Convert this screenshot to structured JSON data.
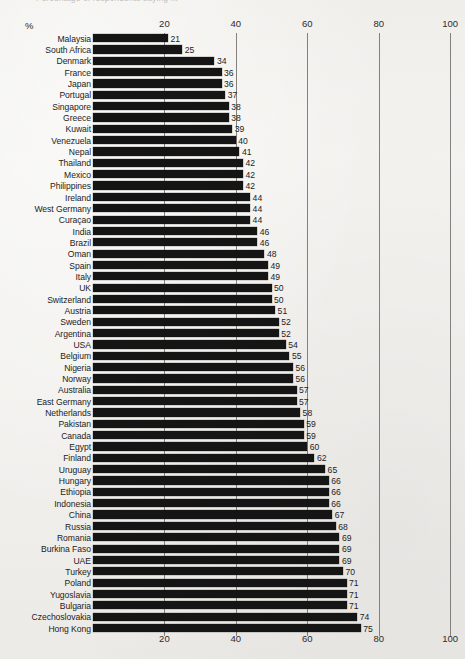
{
  "caption": {
    "clipped_text": "Percentage of respondents saying ...",
    "note": "top caption line is cropped off at the image edge and largely illegible"
  },
  "axis": {
    "unit_label": "%",
    "ticks": [
      0,
      20,
      40,
      60,
      80,
      100
    ],
    "tick_labels": [
      "",
      "20",
      "40",
      "60",
      "80",
      "100"
    ]
  },
  "colors": {
    "bar": "#151515",
    "text": "#232323",
    "gridline": "#6e6d6b",
    "background": "#f2f1ee"
  },
  "chart_data": {
    "type": "bar",
    "orientation": "horizontal",
    "title": "",
    "xlabel": "%",
    "ylabel": "",
    "xlim": [
      0,
      100
    ],
    "grid": true,
    "legend": "none",
    "sorted": "ascending",
    "categories": [
      "Malaysia",
      "South Africa",
      "Denmark",
      "France",
      "Japan",
      "Portugal",
      "Singapore",
      "Greece",
      "Kuwait",
      "Venezuela",
      "Nepal",
      "Thailand",
      "Mexico",
      "Philippines",
      "Ireland",
      "West Germany",
      "Curaçao",
      "India",
      "Brazil",
      "Oman",
      "Spain",
      "Italy",
      "UK",
      "Switzerland",
      "Austria",
      "Sweden",
      "Argentina",
      "USA",
      "Belgium",
      "Nigeria",
      "Norway",
      "Australia",
      "East Germany",
      "Netherlands",
      "Pakistan",
      "Canada",
      "Egypt",
      "Finland",
      "Uruguay",
      "Hungary",
      "Ethiopia",
      "Indonesia",
      "China",
      "Russia",
      "Romania",
      "Burkina Faso",
      "UAE",
      "Turkey",
      "Poland",
      "Yugoslavia",
      "Bulgaria",
      "Czechoslovakia",
      "Hong Kong"
    ],
    "values": [
      21,
      25,
      34,
      36,
      36,
      37,
      38,
      38,
      39,
      40,
      41,
      42,
      42,
      42,
      44,
      44,
      44,
      46,
      46,
      48,
      49,
      49,
      50,
      50,
      51,
      52,
      52,
      54,
      55,
      56,
      56,
      57,
      57,
      58,
      59,
      59,
      60,
      62,
      65,
      66,
      66,
      66,
      67,
      68,
      69,
      69,
      69,
      70,
      71,
      71,
      71,
      74,
      75
    ]
  }
}
